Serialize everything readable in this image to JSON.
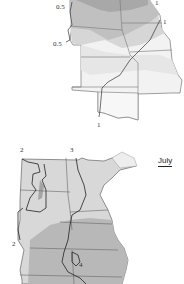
{
  "top_map": {
    "contour_labels": [
      {
        "text": "0.5",
        "x": 56,
        "y": 2
      },
      {
        "text": "1",
        "x": 156,
        "y": -1
      },
      {
        "text": "1",
        "x": 163,
        "y": 18
      },
      {
        "text": "0.5",
        "x": 53,
        "y": 40
      },
      {
        "text": "1",
        "x": 97,
        "y": 121
      }
    ],
    "colors": {
      "darkest": "#a8a8a8",
      "dark": "#c0c0c0",
      "mid": "#d6d6d6",
      "light": "#e6e6e6",
      "lightest": "#f2f2f2"
    }
  },
  "bottom_map": {
    "month_label": "July",
    "contour_labels": [
      {
        "text": "2",
        "x": 20,
        "y": 145
      },
      {
        "text": "3",
        "x": 70,
        "y": 145
      },
      {
        "text": "2",
        "x": 12,
        "y": 239
      },
      {
        "text": "4",
        "x": 79,
        "y": 258
      }
    ],
    "colors": {
      "light": "#d8d8d8",
      "mid": "#b8b8b8",
      "dark": "#a4a4a4",
      "lake": "#eeeeee"
    }
  }
}
